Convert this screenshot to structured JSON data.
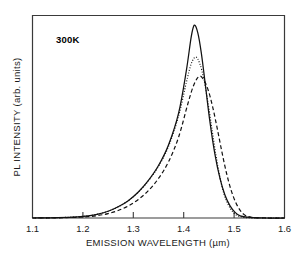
{
  "chart_data": {
    "type": "line",
    "title": "",
    "xlabel": "EMISSION WAVELENGTH (µm)",
    "ylabel": "PL INTENSITY (arb. units)",
    "xlim": [
      1.1,
      1.6
    ],
    "ylim": [
      0,
      1.05
    ],
    "xticks": [
      1.1,
      1.2,
      1.3,
      1.4,
      1.5,
      1.6
    ],
    "xticklabels": [
      "1.1",
      "1.2",
      "1.3",
      "1.4",
      "1.5",
      "1.6"
    ],
    "yticks": [],
    "yticklabels": [],
    "grid": false,
    "legend": false,
    "annotations": [
      {
        "text": "300K",
        "x": 1.165,
        "y": 0.93,
        "bold": true
      }
    ],
    "series": [
      {
        "name": "sample-1",
        "style": "solid",
        "peak_x": 1.421,
        "peak_y": 1.0,
        "x": [
          1.1,
          1.15,
          1.19,
          1.21,
          1.23,
          1.25,
          1.27,
          1.29,
          1.31,
          1.33,
          1.35,
          1.37,
          1.39,
          1.405,
          1.415,
          1.421,
          1.428,
          1.435,
          1.443,
          1.452,
          1.462,
          1.472,
          1.482,
          1.492,
          1.502,
          1.512,
          1.53,
          1.56,
          1.6
        ],
        "y": [
          0.0,
          0.002,
          0.006,
          0.011,
          0.02,
          0.035,
          0.058,
          0.09,
          0.135,
          0.195,
          0.272,
          0.38,
          0.545,
          0.76,
          0.94,
          1.0,
          0.96,
          0.855,
          0.69,
          0.5,
          0.33,
          0.205,
          0.118,
          0.063,
          0.029,
          0.011,
          0.003,
          0.0,
          0.0
        ]
      },
      {
        "name": "sample-2",
        "style": "dotted",
        "peak_x": 1.424,
        "peak_y": 0.835,
        "x": [
          1.1,
          1.15,
          1.19,
          1.21,
          1.23,
          1.25,
          1.27,
          1.29,
          1.31,
          1.33,
          1.35,
          1.37,
          1.39,
          1.405,
          1.415,
          1.424,
          1.432,
          1.44,
          1.448,
          1.456,
          1.464,
          1.472,
          1.48,
          1.489,
          1.498,
          1.508,
          1.525,
          1.555,
          1.6
        ],
        "y": [
          0.0,
          0.002,
          0.006,
          0.011,
          0.02,
          0.035,
          0.058,
          0.09,
          0.134,
          0.193,
          0.268,
          0.372,
          0.53,
          0.7,
          0.8,
          0.835,
          0.8,
          0.72,
          0.6,
          0.462,
          0.325,
          0.21,
          0.124,
          0.066,
          0.03,
          0.011,
          0.002,
          0.0,
          0.0
        ]
      },
      {
        "name": "sample-3",
        "style": "dashed",
        "peak_x": 1.431,
        "peak_y": 0.735,
        "x": [
          1.1,
          1.15,
          1.19,
          1.21,
          1.23,
          1.25,
          1.27,
          1.29,
          1.31,
          1.33,
          1.35,
          1.37,
          1.39,
          1.408,
          1.42,
          1.431,
          1.44,
          1.449,
          1.458,
          1.467,
          1.476,
          1.485,
          1.494,
          1.503,
          1.512,
          1.521,
          1.535,
          1.565,
          1.6
        ],
        "y": [
          0.0,
          0.001,
          0.004,
          0.007,
          0.013,
          0.023,
          0.039,
          0.062,
          0.096,
          0.142,
          0.205,
          0.292,
          0.42,
          0.59,
          0.69,
          0.735,
          0.715,
          0.66,
          0.57,
          0.458,
          0.34,
          0.232,
          0.145,
          0.082,
          0.04,
          0.016,
          0.004,
          0.0,
          0.0
        ]
      }
    ]
  }
}
